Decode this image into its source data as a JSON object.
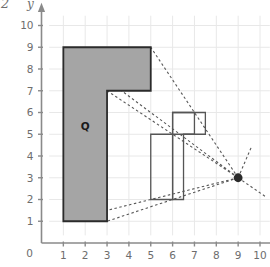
{
  "page": {
    "corner_number": "2"
  },
  "chart_data": {
    "type": "diagram",
    "title": "",
    "xlabel": "x",
    "ylabel": "y",
    "xlim": [
      0,
      10.6
    ],
    "ylim": [
      0,
      10.6
    ],
    "grid": true,
    "x_ticks": [
      "0",
      "1",
      "2",
      "3",
      "4",
      "5",
      "6",
      "7",
      "8",
      "9",
      "10"
    ],
    "y_ticks": [
      "0",
      "1",
      "2",
      "3",
      "4",
      "5",
      "6",
      "7",
      "8",
      "9",
      "10"
    ],
    "shapes": [
      {
        "name": "Q",
        "label": "Q",
        "label_point": [
          2.0,
          5.2
        ],
        "fill": "#a5a5a5",
        "stroke": "#2b2b2b",
        "points": [
          [
            1,
            1
          ],
          [
            3,
            1
          ],
          [
            3,
            7
          ],
          [
            5,
            7
          ],
          [
            5,
            9
          ],
          [
            1,
            9
          ]
        ]
      },
      {
        "name": "image-large",
        "label": "",
        "fill": "none",
        "stroke": "#555555",
        "points": [
          [
            5,
            2
          ],
          [
            6,
            2
          ],
          [
            6,
            6
          ],
          [
            7,
            6
          ],
          [
            7,
            5
          ],
          [
            5,
            5
          ]
        ]
      },
      {
        "name": "image-small",
        "label": "",
        "fill": "none",
        "stroke": "#555555",
        "points": [
          [
            6,
            2
          ],
          [
            6.5,
            2
          ],
          [
            6.5,
            5
          ],
          [
            7.5,
            5
          ],
          [
            7.5,
            6
          ],
          [
            6,
            6
          ]
        ]
      }
    ],
    "center_of_enlargement": {
      "label": "",
      "point": [
        9,
        3
      ],
      "color": "#2b2b2b"
    },
    "ray_lines": [
      {
        "from": [
          9,
          3
        ],
        "to": [
          1,
          9
        ]
      },
      {
        "from": [
          9,
          3
        ],
        "to": [
          5,
          9
        ]
      },
      {
        "from": [
          9,
          3
        ],
        "to": [
          3,
          7
        ]
      },
      {
        "from": [
          9,
          3
        ],
        "to": [
          1,
          1
        ]
      },
      {
        "from": [
          9,
          3
        ],
        "to": [
          3,
          1
        ]
      },
      {
        "from": [
          9,
          3
        ],
        "to": [
          10.3,
          2.1
        ]
      },
      {
        "from": [
          9,
          3
        ],
        "to": [
          9.6,
          4.4
        ]
      }
    ],
    "ray_style": {
      "dash": "2.5 2.5",
      "color": "#585858",
      "width": 1.1
    }
  }
}
